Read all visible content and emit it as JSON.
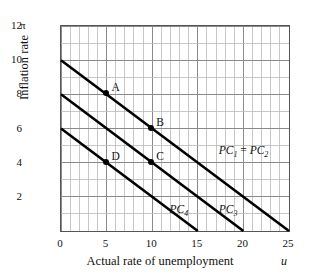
{
  "chart_data": {
    "type": "line",
    "title": "",
    "xlabel": "Actual rate of unemployment",
    "ylabel": "Inflation rate",
    "x_axis_symbol": "u",
    "y_axis_symbol": "π",
    "xlim": [
      0,
      25
    ],
    "ylim": [
      0,
      12
    ],
    "xticks": [
      0,
      5,
      10,
      15,
      20,
      25
    ],
    "yticks": [
      2,
      4,
      6,
      8,
      10,
      12
    ],
    "xtick_labels": [
      "0",
      "5",
      "10",
      "15",
      "20",
      "25"
    ],
    "ytick_labels": [
      "2",
      "4",
      "6",
      "8",
      "10",
      "12"
    ],
    "grid": true,
    "grid_minor_step_x": 1,
    "grid_minor_step_y": 1,
    "grid_major_step_x": 5,
    "grid_major_step_y": 2,
    "legend": "none",
    "series": [
      {
        "name": "PC1 = PC2",
        "label_html": "PC<sub>1</sub> <span class=\"eq\">=</span> PC<sub>2</sub>",
        "points": [
          [
            0,
            10
          ],
          [
            25,
            0
          ]
        ],
        "slope": -0.4,
        "intercept": 10,
        "color": "#000000",
        "label_x": 17.4,
        "label_y": 5.0
      },
      {
        "name": "PC3",
        "label_html": "PC<sub>3</sub>",
        "points": [
          [
            0,
            8
          ],
          [
            20,
            0
          ]
        ],
        "slope": -0.4,
        "intercept": 8,
        "color": "#000000",
        "label_x": 17.4,
        "label_y": 1.55
      },
      {
        "name": "PC4",
        "label_html": "PC<sub>4</sub>",
        "points": [
          [
            0,
            6
          ],
          [
            15,
            0
          ]
        ],
        "slope": -0.4,
        "intercept": 6,
        "color": "#000000",
        "label_x": 12.0,
        "label_y": 1.55
      }
    ],
    "annotations": [
      {
        "label": "A",
        "x": 5,
        "y": 8,
        "on_curve": "PC1 = PC2",
        "label_dx": 6,
        "label_dy": -11
      },
      {
        "label": "B",
        "x": 10,
        "y": 6,
        "on_curve": "PC1 = PC2",
        "label_dx": 5,
        "label_dy": -11
      },
      {
        "label": "C",
        "x": 10,
        "y": 4,
        "on_curve": "PC3",
        "label_dx": 5,
        "label_dy": -11
      },
      {
        "label": "D",
        "x": 5,
        "y": 4,
        "on_curve": "PC4",
        "label_dx": 6,
        "label_dy": -11
      }
    ],
    "colors": {
      "line": "#000000",
      "grid_minor": "#b9b9b9",
      "grid_major": "#8a8a8a",
      "frame": "#555555",
      "text": "#111111",
      "background": "#ffffff"
    }
  }
}
